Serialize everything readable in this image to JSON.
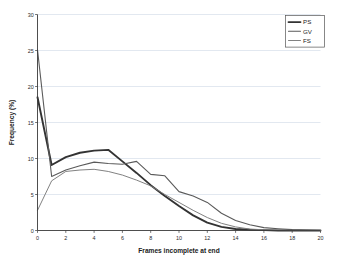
{
  "chart_data": {
    "type": "line",
    "title": "",
    "xlabel": "Frames incomplete at end",
    "ylabel": "Frequency (%)",
    "xlim": [
      0,
      20
    ],
    "ylim": [
      0,
      30
    ],
    "xticks": [
      "0",
      "2",
      "4",
      "6",
      "8",
      "10",
      "12",
      "14",
      "16",
      "18",
      "20"
    ],
    "yticks": [
      "0",
      "5",
      "10",
      "15",
      "20",
      "25",
      "30"
    ],
    "grid": "horizontal",
    "legend_position": "top-right",
    "x": [
      0,
      1,
      2,
      3,
      4,
      5,
      6,
      7,
      8,
      9,
      10,
      11,
      12,
      13,
      14,
      15,
      16,
      17,
      18,
      19,
      20
    ],
    "series": [
      {
        "name": "PS",
        "color": "#333333",
        "width": 1.9,
        "values": [
          18.5,
          9.1,
          10.2,
          10.8,
          11.1,
          11.2,
          9.6,
          8.0,
          6.3,
          4.8,
          3.4,
          2.1,
          1.1,
          0.5,
          0.2,
          0.1,
          0.05,
          0.0,
          0.0,
          0.0,
          0.0
        ]
      },
      {
        "name": "GV",
        "color": "#5a5a5a",
        "width": 1.1,
        "values": [
          25.1,
          7.5,
          8.4,
          9.0,
          9.5,
          9.3,
          9.2,
          9.6,
          7.8,
          7.6,
          5.4,
          4.8,
          3.9,
          2.4,
          1.4,
          0.8,
          0.4,
          0.25,
          0.12,
          0.05,
          0.0
        ]
      },
      {
        "name": "FS",
        "color": "#7a7a7a",
        "width": 0.95,
        "values": [
          2.8,
          6.9,
          8.2,
          8.4,
          8.5,
          8.2,
          7.7,
          7.0,
          6.2,
          5.0,
          3.9,
          2.8,
          1.8,
          1.0,
          0.5,
          0.2,
          0.1,
          0.05,
          0.0,
          0.0,
          0.0
        ]
      }
    ],
    "legend": [
      {
        "label": "PS"
      },
      {
        "label": "GV"
      },
      {
        "label": "FS"
      }
    ]
  }
}
